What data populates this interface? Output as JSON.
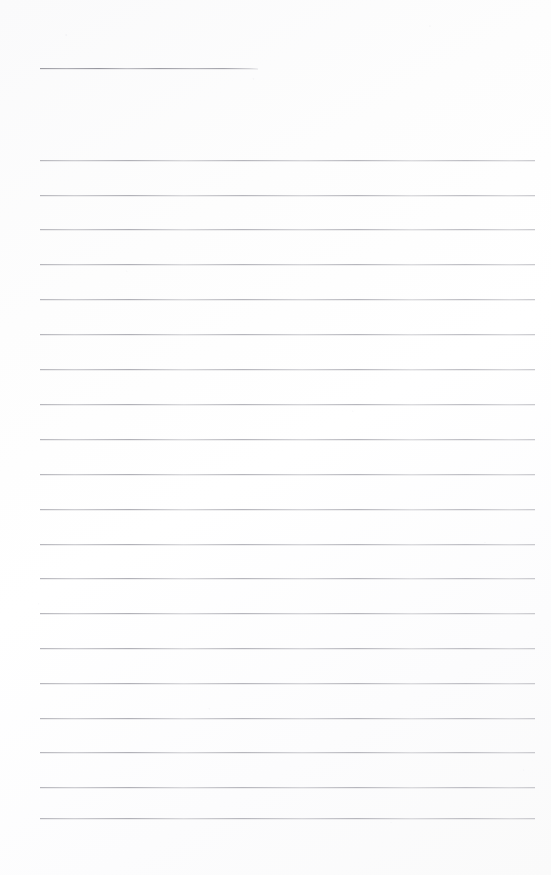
{
  "document": {
    "kind": "scanned-lined-page",
    "title": "",
    "body_text": "",
    "background_color": "#fdfdfd",
    "rule_color": "#b0b0b6",
    "header_rule_color": "#969 69d",
    "page_width": 551,
    "page_height": 875
  },
  "header_rule": {
    "label": "",
    "x": 40,
    "y": 68,
    "width": 218
  },
  "rules": [
    {
      "label": "",
      "x": 40,
      "y": 160,
      "width": 495
    },
    {
      "label": "",
      "x": 40,
      "y": 195,
      "width": 495
    },
    {
      "label": "",
      "x": 40,
      "y": 229,
      "width": 495
    },
    {
      "label": "",
      "x": 40,
      "y": 264,
      "width": 495
    },
    {
      "label": "",
      "x": 40,
      "y": 299,
      "width": 495
    },
    {
      "label": "",
      "x": 40,
      "y": 334,
      "width": 495
    },
    {
      "label": "",
      "x": 40,
      "y": 369,
      "width": 495
    },
    {
      "label": "",
      "x": 40,
      "y": 404,
      "width": 495
    },
    {
      "label": "",
      "x": 40,
      "y": 439,
      "width": 495
    },
    {
      "label": "",
      "x": 40,
      "y": 474,
      "width": 495
    },
    {
      "label": "",
      "x": 40,
      "y": 509,
      "width": 495
    },
    {
      "label": "",
      "x": 40,
      "y": 544,
      "width": 495
    },
    {
      "label": "",
      "x": 40,
      "y": 578,
      "width": 495
    },
    {
      "label": "",
      "x": 40,
      "y": 613,
      "width": 495
    },
    {
      "label": "",
      "x": 40,
      "y": 648,
      "width": 495
    },
    {
      "label": "",
      "x": 40,
      "y": 683,
      "width": 495
    },
    {
      "label": "",
      "x": 40,
      "y": 718,
      "width": 495
    },
    {
      "label": "",
      "x": 40,
      "y": 752,
      "width": 495
    },
    {
      "label": "",
      "x": 40,
      "y": 787,
      "width": 495
    },
    {
      "label": "",
      "x": 40,
      "y": 818,
      "width": 495
    }
  ]
}
